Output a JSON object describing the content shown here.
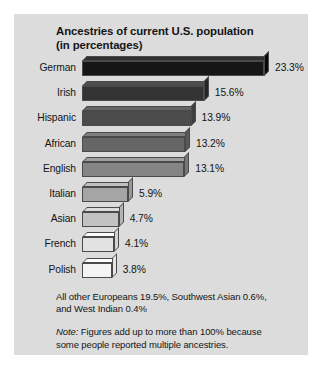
{
  "chart_data": {
    "type": "bar",
    "orientation": "horizontal",
    "title": "Ancestries of current U.S. population (in percentages)",
    "title_lines": [
      "Ancestries of current U.S. population",
      "(in percentages)"
    ],
    "categories": [
      "German",
      "Irish",
      "Hispanic",
      "African",
      "English",
      "Italian",
      "Asian",
      "French",
      "Polish"
    ],
    "values": [
      23.3,
      15.6,
      13.9,
      13.2,
      13.1,
      5.9,
      4.7,
      4.1,
      3.8
    ],
    "value_labels": [
      "23.3%",
      "15.6%",
      "13.9%",
      "13.2%",
      "13.1%",
      "5.9%",
      "4.7%",
      "4.1%",
      "3.8%"
    ],
    "bar_colors": [
      "#161616",
      "#333333",
      "#4c4c4c",
      "#666666",
      "#858585",
      "#a5a5a5",
      "#c2c2c2",
      "#e2e2e2",
      "#f4f4f4"
    ],
    "xlabel": "",
    "ylabel": "",
    "xlim": [
      0,
      23.3
    ],
    "grid": false,
    "legend": false,
    "annotations": [
      "All other Europeans 19.5%, Southwest Asian 0.6%, and West Indian 0.4%",
      "Note: Figures add up to more than 100% because some people reported multiple ancestries."
    ]
  },
  "footnotes": {
    "other_line1": "All other Europeans 19.5%, Southwest Asian 0.6%,",
    "other_line2": "and West Indian 0.4%",
    "note_prefix": "Note:",
    "note_line1": " Figures add up to more than 100% because",
    "note_line2": "some people reported multiple ancestries."
  },
  "colors": {
    "panel_background": "#dcdcdc",
    "text": "#141414",
    "bar_outline": "#4a4a4a"
  }
}
